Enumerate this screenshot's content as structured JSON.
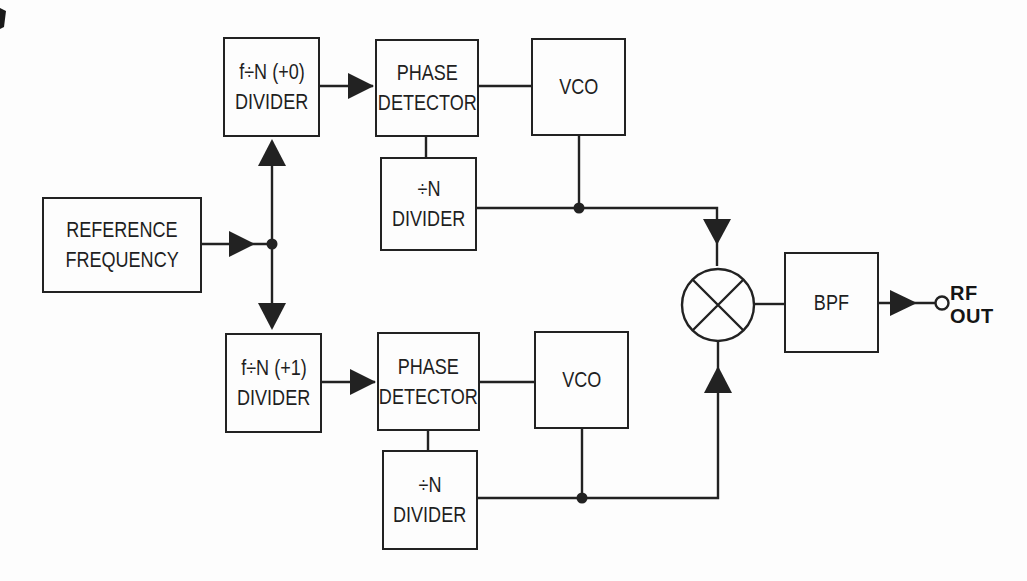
{
  "diagram_type": "block-diagram",
  "blocks": {
    "reference": {
      "line1": "REFERENCE",
      "line2": "FREQUENCY"
    },
    "divider_plus0": {
      "line1": "f÷N (+0)",
      "line2": "DIVIDER"
    },
    "phase_detector_top": {
      "line1": "PHASE",
      "line2": "DETECTOR"
    },
    "vco_top": {
      "line1": "VCO"
    },
    "n_divider_top": {
      "line1": "÷N",
      "line2": "DIVIDER"
    },
    "divider_plus1": {
      "line1": "f÷N (+1)",
      "line2": "DIVIDER"
    },
    "phase_detector_bottom": {
      "line1": "PHASE",
      "line2": "DETECTOR"
    },
    "vco_bottom": {
      "line1": "VCO"
    },
    "n_divider_bottom": {
      "line1": "÷N",
      "line2": "DIVIDER"
    },
    "bpf": {
      "line1": "BPF"
    }
  },
  "output_label": {
    "line1": "RF",
    "line2": "OUT"
  },
  "icons": {
    "mixer": "mixer-icon (circle with X)",
    "arrowhead": "solid-triangle-arrowhead-icon",
    "junction": "junction-dot-icon",
    "terminal": "open-circle-terminal-icon"
  },
  "colors": {
    "line": "#222222",
    "text": "#1f1f1f",
    "background": "#fdfdfd"
  }
}
